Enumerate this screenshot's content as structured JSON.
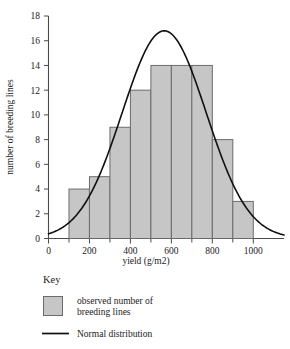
{
  "chart_data": {
    "type": "bar",
    "title": "",
    "subtitle": "",
    "xlabel": "yield (g/m2)",
    "ylabel": "number of breeding lines",
    "xlim": [
      0,
      1150
    ],
    "ylim": [
      0,
      18
    ],
    "grid": false,
    "bin_width": 100,
    "categories": [
      "100-200",
      "200-300",
      "300-400",
      "400-500",
      "500-600",
      "600-700",
      "700-800",
      "800-900",
      "900-1000"
    ],
    "bin_starts": [
      100,
      200,
      300,
      400,
      500,
      600,
      700,
      800,
      900
    ],
    "values": [
      4,
      5,
      9,
      12,
      14,
      14,
      14,
      8,
      3
    ],
    "x_ticks_major": [
      0,
      200,
      400,
      600,
      800,
      1000
    ],
    "x_tick_labels": [
      "0",
      "200",
      "400",
      "600",
      "800",
      "1000"
    ],
    "x_ticks_minor": [
      100,
      300,
      500,
      700,
      900
    ],
    "y_ticks": [
      0,
      2,
      4,
      6,
      8,
      10,
      12,
      14,
      16,
      18
    ],
    "y_tick_labels": [
      "0",
      "2",
      "4",
      "6",
      "8",
      "10",
      "12",
      "14",
      "16",
      "18"
    ],
    "series": [
      {
        "name": "observed number of breeding lines",
        "type": "bar",
        "values": [
          4,
          5,
          9,
          12,
          14,
          14,
          14,
          8,
          3
        ]
      },
      {
        "name": "Normal distribution",
        "type": "line",
        "mean": 565,
        "sigma": 205,
        "peak_value": 16.8,
        "peak_x": 565
      }
    ],
    "legend": {
      "position": "below-left",
      "title": "Key",
      "entries": [
        {
          "label_line1": "observed number of",
          "label_line2": "breeding lines",
          "marker": "filled-square",
          "color": "#c6c6c6"
        },
        {
          "label_line1": "Normal distribution",
          "label_line2": "",
          "marker": "solid-line",
          "color": "#101010"
        }
      ]
    },
    "colors": {
      "bar_fill": "#c6c6c6",
      "bar_stroke": "#6b6b6b",
      "curve": "#101010",
      "axis": "#4a4a4a",
      "text": "#1a1a1a",
      "background": "#ffffff"
    }
  }
}
